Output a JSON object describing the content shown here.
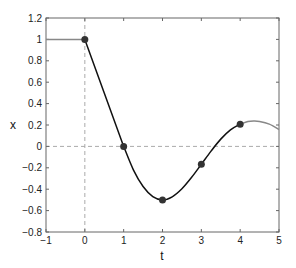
{
  "chart_data": {
    "type": "line",
    "title": "",
    "xlabel": "t",
    "ylabel": "x",
    "xlim": [
      -1,
      5
    ],
    "ylim": [
      -0.8,
      1.2
    ],
    "xticks": [
      -1,
      0,
      1,
      2,
      3,
      4,
      5
    ],
    "yticks": [
      -0.8,
      -0.6,
      -0.4,
      -0.2,
      0,
      0.2,
      0.4,
      0.6,
      0.8,
      1,
      1.2
    ],
    "xtick_labels": [
      "−1",
      "0",
      "1",
      "2",
      "3",
      "4",
      "5"
    ],
    "ytick_labels": [
      "−0.8",
      "−0.6",
      "−0.4",
      "−0.2",
      "0",
      "0.2",
      "0.4",
      "0.6",
      "0.8",
      "1",
      "1.2"
    ],
    "grid": false,
    "reference_lines": [
      {
        "orientation": "horizontal",
        "value": 0,
        "style": "dashed",
        "color": "#aaaaaa"
      },
      {
        "orientation": "vertical",
        "value": 0,
        "style": "dashed",
        "color": "#aaaaaa"
      }
    ],
    "series": [
      {
        "name": "history",
        "color": "#888888",
        "x": [
          -1,
          0
        ],
        "values": [
          1,
          1
        ]
      },
      {
        "name": "solution",
        "color": "#111111",
        "x": [
          0,
          0.5,
          1,
          1.25,
          1.5,
          1.75,
          2,
          2.25,
          2.5,
          2.75,
          3,
          3.25,
          3.5,
          3.75,
          4
        ],
        "values": [
          1,
          0.5,
          0,
          -0.219,
          -0.375,
          -0.469,
          -0.5,
          -0.471,
          -0.396,
          -0.289,
          -0.167,
          -0.044,
          0.068,
          0.155,
          0.208
        ]
      },
      {
        "name": "extension",
        "color": "#888888",
        "x": [
          4,
          4.2,
          4.35,
          4.5,
          4.75,
          5
        ],
        "values": [
          0.208,
          0.232,
          0.237,
          0.233,
          0.208,
          0.158
        ]
      },
      {
        "name": "markers",
        "type": "scatter",
        "color": "#333333",
        "x": [
          0,
          1,
          2,
          3,
          4
        ],
        "values": [
          1,
          0,
          -0.5,
          -0.167,
          0.208
        ]
      }
    ]
  }
}
